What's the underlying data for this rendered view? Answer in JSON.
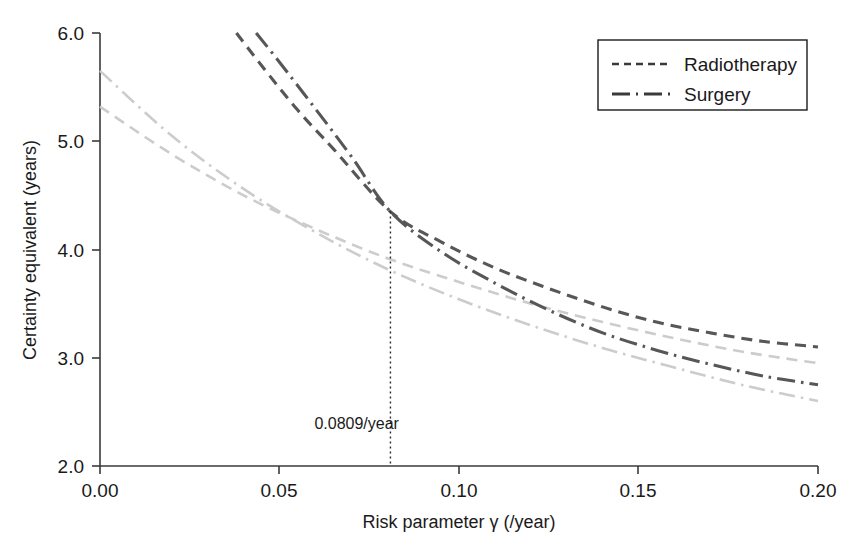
{
  "chart_data": {
    "type": "line",
    "title": "",
    "xlabel": "Risk parameter γ (/year)",
    "ylabel": "Certainty equivalent (years)",
    "xlim": [
      0.0,
      0.2
    ],
    "ylim": [
      2.0,
      6.0
    ],
    "grid": false,
    "legend_position": "top-right",
    "xticks": [
      "0.00",
      "0.05",
      "0.10",
      "0.15",
      "0.20"
    ],
    "xtick_values": [
      0.0,
      0.05,
      0.1,
      0.15,
      0.2
    ],
    "yticks": [
      "2.0",
      "3.0",
      "4.0",
      "5.0",
      "6.0"
    ],
    "ytick_values": [
      2.0,
      3.0,
      4.0,
      5.0,
      6.0
    ],
    "annotations": [
      {
        "label": "0.0809/year",
        "x": 0.0809,
        "y_top": 4.35,
        "y_bottom": 2.0,
        "style": "dotted-vertical",
        "text_x": 0.0715,
        "text_y": 2.34
      }
    ],
    "series": [
      {
        "name": "Radiotherapy",
        "group": "primary",
        "linestyle": "dashed",
        "color": "#575757",
        "width": 3.1,
        "dasharray": "11 7",
        "x": [
          0.038,
          0.045,
          0.055,
          0.065,
          0.0809,
          0.095,
          0.11,
          0.125,
          0.14,
          0.155,
          0.17,
          0.185,
          0.2
        ],
        "y": [
          6.0,
          5.7,
          5.29,
          4.93,
          4.35,
          4.07,
          3.83,
          3.64,
          3.47,
          3.33,
          3.23,
          3.15,
          3.1
        ]
      },
      {
        "name": "Surgery",
        "group": "primary",
        "linestyle": "dashdot",
        "color": "#575757",
        "width": 3.1,
        "dasharray": "18 6 2.5 6",
        "x": [
          0.0435,
          0.05,
          0.06,
          0.07,
          0.0809,
          0.095,
          0.11,
          0.125,
          0.14,
          0.155,
          0.17,
          0.185,
          0.2
        ],
        "y": [
          6.0,
          5.73,
          5.3,
          4.86,
          4.35,
          3.98,
          3.69,
          3.44,
          3.23,
          3.07,
          2.94,
          2.83,
          2.75
        ]
      },
      {
        "name": "Radiotherapy",
        "group": "secondary",
        "linestyle": "dashed",
        "color": "#cccccc",
        "width": 2.6,
        "dasharray": "11 7",
        "x": [
          0.0,
          0.02,
          0.04,
          0.06,
          0.08,
          0.1,
          0.12,
          0.14,
          0.16,
          0.18,
          0.2
        ],
        "y": [
          5.32,
          4.88,
          4.5,
          4.19,
          3.92,
          3.7,
          3.5,
          3.33,
          3.18,
          3.05,
          2.95
        ]
      },
      {
        "name": "Surgery",
        "group": "secondary",
        "linestyle": "dashdot",
        "color": "#cccccc",
        "width": 2.6,
        "dasharray": "16 6 2.5 6",
        "x": [
          0.0,
          0.02,
          0.04,
          0.06,
          0.08,
          0.1,
          0.12,
          0.14,
          0.16,
          0.18,
          0.2
        ],
        "y": [
          5.65,
          5.05,
          4.56,
          4.16,
          3.82,
          3.54,
          3.3,
          3.09,
          2.91,
          2.74,
          2.6
        ]
      }
    ],
    "legend": [
      {
        "label": "Radiotherapy",
        "linestyle": "dashed",
        "color": "#3a3a3a"
      },
      {
        "label": "Surgery",
        "linestyle": "dashdot",
        "color": "#3a3a3a"
      }
    ]
  },
  "caption": {
    "ghost_text": ""
  }
}
